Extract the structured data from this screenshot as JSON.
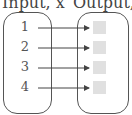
{
  "headings": {
    "input": "Input, x",
    "output": "Output, f(x)"
  },
  "inputs": [
    "1",
    "2",
    "3",
    "4"
  ],
  "outputs": [
    "",
    "",
    "",
    ""
  ],
  "colors": {
    "stroke": "#555555",
    "output_placeholder": "#e0e0e0"
  }
}
